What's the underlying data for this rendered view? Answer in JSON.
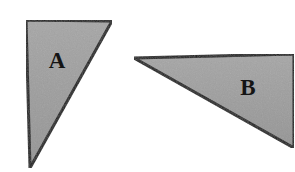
{
  "canvas": {
    "width": 295,
    "height": 172,
    "background_color": "#ffffff"
  },
  "style": {
    "fill_color": "#9c9c9c",
    "fill_color_light": "#a8a8a8",
    "fill_color_dark": "#8f8f8f",
    "outline_color": "#1a1a1a",
    "outline_width": 3,
    "label_color": "#141414"
  },
  "figure": {
    "type": "geometry-diagram",
    "shapes": [
      {
        "id": "triangle-a",
        "label": "A",
        "points": "26,20 112,21 30,168",
        "label_x": 57,
        "label_y": 63,
        "vertices": [
          {
            "name": "top-left",
            "x": 26,
            "y": 20
          },
          {
            "name": "top-right",
            "x": 112,
            "y": 21
          },
          {
            "name": "bottom",
            "x": 30,
            "y": 168
          }
        ]
      },
      {
        "id": "triangle-b",
        "label": "B",
        "points": "134,58 294,54 294,148",
        "label_x": 248,
        "label_y": 90,
        "vertices": [
          {
            "name": "left",
            "x": 134,
            "y": 58
          },
          {
            "name": "top-right",
            "x": 294,
            "y": 54
          },
          {
            "name": "bottom-right",
            "x": 294,
            "y": 148
          }
        ]
      }
    ]
  }
}
